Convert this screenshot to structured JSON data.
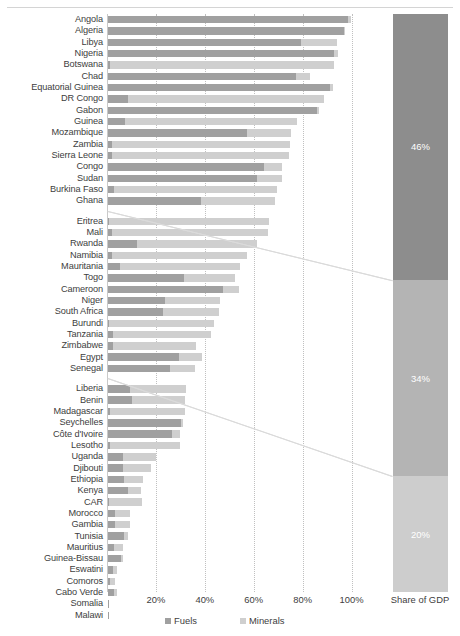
{
  "chart_data": {
    "type": "bar",
    "subtype": "stacked-horizontal",
    "title": "",
    "xlabel": "",
    "ylabel": "",
    "xlim": [
      0,
      110
    ],
    "grid": true,
    "grid_axis": "x",
    "legend_position": "bottom",
    "xticks": [
      "20%",
      "40%",
      "60%",
      "80%",
      "100%"
    ],
    "xtick_values": [
      20,
      40,
      60,
      80,
      100
    ],
    "series": [
      {
        "name": "Fuels",
        "color": "#a0a0a0"
      },
      {
        "name": "Minerals",
        "color": "#cfcfcf"
      }
    ],
    "groups": [
      {
        "id": "high",
        "share_of_gdp": "46%",
        "categories": [
          "Angola",
          "Algeria",
          "Libya",
          "Nigeria",
          "Botswana",
          "Chad",
          "Equatorial Guinea",
          "DR Congo",
          "Gabon",
          "Guinea",
          "Mozambique",
          "Zambia",
          "Sierra Leone",
          "Congo",
          "Sudan",
          "Burkina Faso",
          "Ghana"
        ],
        "fuels": [
          98.0,
          96.5,
          79.0,
          92.5,
          1.0,
          77.0,
          91.0,
          8.0,
          85.5,
          7.0,
          57.0,
          1.5,
          1.5,
          64.0,
          61.0,
          2.5,
          38.0
        ],
        "minerals": [
          1.5,
          0.5,
          14.5,
          1.5,
          91.5,
          5.5,
          1.0,
          80.5,
          1.0,
          70.5,
          18.0,
          73.0,
          72.5,
          7.0,
          10.0,
          66.5,
          30.5
        ]
      },
      {
        "id": "medium",
        "share_of_gdp": "34%",
        "categories": [
          "Eritrea",
          "Mali",
          "Rwanda",
          "Namibia",
          "Mauritania",
          "Togo",
          "Cameroon",
          "Niger",
          "South Africa",
          "Burundi",
          "Tanzania",
          "Zimbabwe",
          "Egypt",
          "Senegal"
        ],
        "fuels": [
          0.5,
          1.5,
          12.0,
          1.5,
          5.0,
          31.0,
          47.0,
          23.5,
          22.5,
          0.5,
          2.0,
          2.0,
          29.0,
          25.5
        ],
        "minerals": [
          65.5,
          64.0,
          49.0,
          55.5,
          49.0,
          21.0,
          6.5,
          22.5,
          23.0,
          43.0,
          40.0,
          34.0,
          9.5,
          10.0
        ]
      },
      {
        "id": "low",
        "share_of_gdp": "20%",
        "categories": [
          "Liberia",
          "Benin",
          "Madagascar",
          "Seychelles",
          "Côte d'Ivoire",
          "Lesotho",
          "Uganda",
          "Djibouti",
          "Ethiopia",
          "Kenya",
          "CAR",
          "Morocco",
          "Gambia",
          "Tunisia",
          "Mauritius",
          "Guinea-Bissau",
          "Eswatini",
          "Comoros",
          "Cabo Verde",
          "Somalia",
          "Malawi"
        ],
        "fuels": [
          9.0,
          10.0,
          1.0,
          30.0,
          26.0,
          1.0,
          6.0,
          6.0,
          6.5,
          8.0,
          0.5,
          3.0,
          3.0,
          6.5,
          2.5,
          5.5,
          2.0,
          1.0,
          2.5,
          0.3,
          0.3
        ],
        "minerals": [
          23.0,
          21.5,
          30.5,
          0.5,
          3.5,
          28.5,
          13.5,
          11.5,
          8.0,
          5.5,
          13.5,
          6.0,
          6.0,
          1.5,
          3.5,
          0.5,
          1.5,
          2.0,
          1.0,
          0.0,
          0.0
        ]
      }
    ],
    "side_bar": {
      "label": "Share of GDP",
      "segments": [
        {
          "label": "46%",
          "value": 46,
          "color": "#8d8d8d"
        },
        {
          "label": "34%",
          "value": 34,
          "color": "#b4b4b4"
        },
        {
          "label": "20%",
          "value": 20,
          "color": "#cdcdcd"
        }
      ]
    },
    "legend": [
      {
        "label": "Fuels",
        "color": "#a0a0a0"
      },
      {
        "label": "Minerals",
        "color": "#cfcfcf"
      }
    ]
  }
}
